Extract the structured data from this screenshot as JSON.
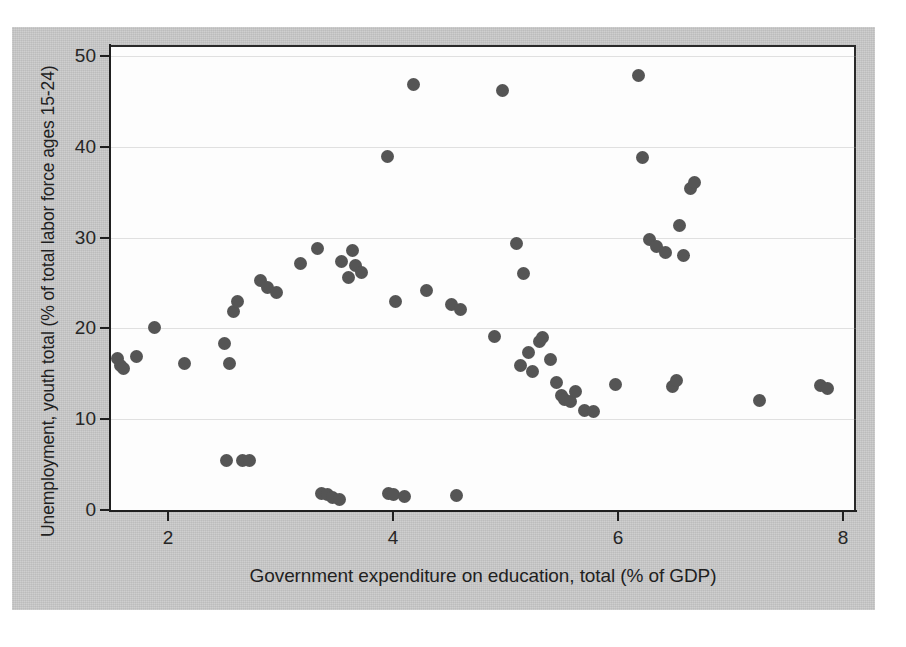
{
  "figure": {
    "background_color": "#c9c9c9",
    "panel_color": "#fdfdfd",
    "marker_color": "#555555",
    "axis_color": "#1f1f1f"
  },
  "chart_data": {
    "type": "scatter",
    "title": "",
    "subtitle": "",
    "xlabel": "Government expenditure on education, total (% of GDP)",
    "ylabel": "Unemployment, youth total (% of total labor force ages 15-24)",
    "xlim": [
      1.4,
      8.1
    ],
    "ylim": [
      -1.5,
      52
    ],
    "xticks": [
      2,
      4,
      6,
      8
    ],
    "xtick_labels": [
      "2",
      "4",
      "6",
      "8"
    ],
    "yticks": [
      0,
      10,
      20,
      30,
      40,
      50
    ],
    "ytick_labels": [
      "0",
      "10",
      "20",
      "30",
      "40",
      "50"
    ],
    "grid": "horizontal-faint",
    "legend": "none",
    "marker_size_px": 13,
    "points": [
      [
        1.55,
        16.7
      ],
      [
        1.58,
        15.9
      ],
      [
        1.6,
        15.6
      ],
      [
        1.72,
        16.9
      ],
      [
        1.88,
        20.1
      ],
      [
        2.15,
        16.1
      ],
      [
        2.5,
        18.3
      ],
      [
        2.52,
        5.4
      ],
      [
        2.55,
        16.1
      ],
      [
        2.58,
        21.9
      ],
      [
        2.62,
        23.0
      ],
      [
        2.66,
        5.4
      ],
      [
        2.72,
        5.4
      ],
      [
        2.82,
        25.3
      ],
      [
        2.88,
        24.5
      ],
      [
        2.96,
        23.9
      ],
      [
        3.18,
        27.2
      ],
      [
        3.33,
        28.8
      ],
      [
        3.36,
        1.8
      ],
      [
        3.42,
        1.7
      ],
      [
        3.46,
        1.4
      ],
      [
        3.52,
        1.2
      ],
      [
        3.54,
        27.4
      ],
      [
        3.6,
        25.6
      ],
      [
        3.64,
        28.6
      ],
      [
        3.67,
        26.9
      ],
      [
        3.72,
        26.2
      ],
      [
        3.95,
        38.9
      ],
      [
        3.96,
        1.8
      ],
      [
        4.0,
        1.7
      ],
      [
        4.02,
        23.0
      ],
      [
        4.1,
        1.5
      ],
      [
        4.18,
        46.9
      ],
      [
        4.3,
        24.2
      ],
      [
        4.52,
        22.6
      ],
      [
        4.56,
        1.6
      ],
      [
        4.6,
        22.1
      ],
      [
        4.9,
        19.1
      ],
      [
        4.97,
        46.2
      ],
      [
        5.1,
        29.3
      ],
      [
        5.13,
        15.9
      ],
      [
        5.16,
        26.0
      ],
      [
        5.2,
        17.3
      ],
      [
        5.24,
        15.2
      ],
      [
        5.3,
        18.6
      ],
      [
        5.33,
        19.0
      ],
      [
        5.4,
        16.6
      ],
      [
        5.45,
        14.0
      ],
      [
        5.5,
        12.6
      ],
      [
        5.52,
        12.2
      ],
      [
        5.58,
        12.0
      ],
      [
        5.62,
        13.0
      ],
      [
        5.7,
        11.0
      ],
      [
        5.78,
        10.8
      ],
      [
        5.98,
        13.8
      ],
      [
        6.18,
        47.9
      ],
      [
        6.22,
        38.8
      ],
      [
        6.28,
        29.8
      ],
      [
        6.34,
        29.0
      ],
      [
        6.42,
        28.4
      ],
      [
        6.48,
        13.6
      ],
      [
        6.52,
        14.3
      ],
      [
        6.55,
        31.3
      ],
      [
        6.58,
        28.0
      ],
      [
        6.64,
        35.4
      ],
      [
        6.68,
        36.1
      ],
      [
        7.26,
        12.1
      ],
      [
        7.8,
        13.7
      ],
      [
        7.86,
        13.4
      ]
    ]
  }
}
